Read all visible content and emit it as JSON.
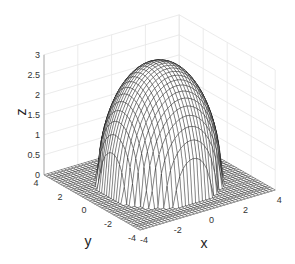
{
  "chart_data": {
    "type": "surface3d",
    "title": "",
    "function": "z = sqrt(9 - x^2 - y^2) (hemisphere of radius 3, zero outside)",
    "xlabel": "x",
    "ylabel": "y",
    "zlabel": "z",
    "xlim": [
      -4,
      4
    ],
    "ylim": [
      -4,
      4
    ],
    "zlim": [
      0,
      3
    ],
    "xticks": [
      -4,
      -2,
      0,
      2,
      4
    ],
    "yticks": [
      -4,
      -2,
      0,
      2,
      4
    ],
    "zticks": [
      0,
      0.5,
      1,
      1.5,
      2,
      2.5,
      3
    ],
    "xtick_labels": [
      "-4",
      "-2",
      "0",
      "2",
      "4"
    ],
    "ytick_labels": [
      "-4",
      "-2",
      "0",
      "2",
      "4"
    ],
    "ztick_labels": [
      "0",
      "0.5",
      "1",
      "1.5",
      "2",
      "2.5",
      "3"
    ],
    "grid": true,
    "mesh_resolution": 41,
    "radius": 3,
    "colors": {
      "mesh": "#000000",
      "grid": "#e6e6e6",
      "axis": "#999999"
    }
  }
}
